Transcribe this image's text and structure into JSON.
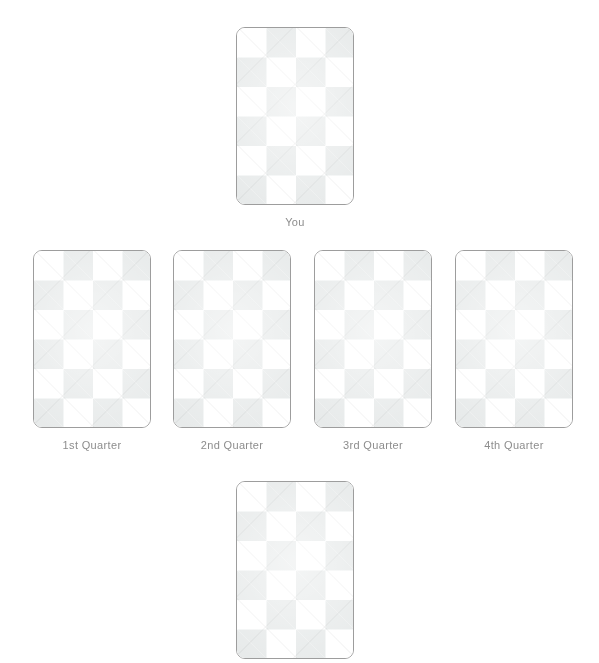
{
  "spread": {
    "name": "Quarterly Card Spread",
    "card_back": {
      "pattern": "argyle-diamond-lattice",
      "base_color": "#ffffff",
      "diamond_color": "#e7eaea",
      "border_color": "#9d9d9d",
      "face_up": false
    },
    "caption_color": "#8d8d8d",
    "positions": [
      {
        "id": "you",
        "label": "You",
        "row": "top",
        "face_up": false,
        "card_icon": "card-back-icon"
      },
      {
        "id": "first-quarter",
        "label": "1st Quarter",
        "row": "middle",
        "face_up": false,
        "card_icon": "card-back-icon"
      },
      {
        "id": "second-quarter",
        "label": "2nd Quarter",
        "row": "middle",
        "face_up": false,
        "card_icon": "card-back-icon"
      },
      {
        "id": "third-quarter",
        "label": "3rd Quarter",
        "row": "middle",
        "face_up": false,
        "card_icon": "card-back-icon"
      },
      {
        "id": "fourth-quarter",
        "label": "4th Quarter",
        "row": "middle",
        "face_up": false,
        "card_icon": "card-back-icon"
      },
      {
        "id": "bottom",
        "label": "",
        "row": "bottom",
        "face_up": false,
        "card_icon": "card-back-icon"
      }
    ]
  }
}
